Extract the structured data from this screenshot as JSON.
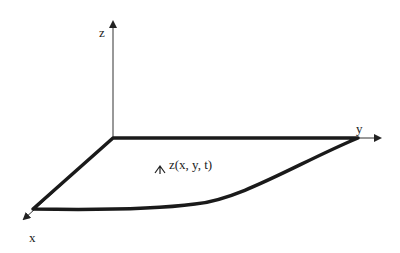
{
  "diagram": {
    "axes": {
      "z_label": "z",
      "y_label": "y",
      "x_label": "x"
    },
    "surface_label": "z(x, y, t)",
    "colors": {
      "stroke": "#1a1a1a",
      "axis": "#333333",
      "background": "#ffffff"
    }
  }
}
